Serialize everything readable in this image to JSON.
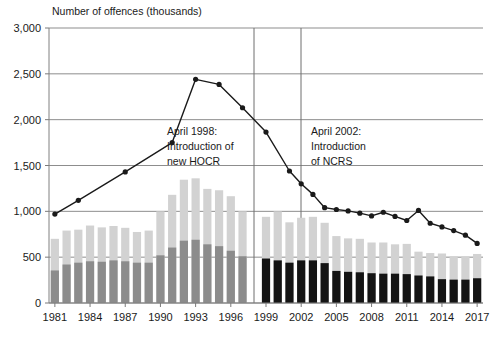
{
  "chart_data": {
    "type": "bar",
    "title": "Number of offences (thousands)",
    "xlabel": "",
    "ylabel": "Number of offences (thousands)",
    "ylim": [
      0,
      3000
    ],
    "ytick_values": [
      0,
      500,
      1000,
      1500,
      2000,
      2500,
      3000
    ],
    "ytick_labels": [
      "0",
      "500",
      "1,000",
      "1,500",
      "2,000",
      "2,500",
      "3,000"
    ],
    "grid": true,
    "legend_position": "none",
    "categories": [
      "1981",
      "1982",
      "1983",
      "1984",
      "1985",
      "1986",
      "1987",
      "1988",
      "1989",
      "1990",
      "1991",
      "1992",
      "1993",
      "1994",
      "1995",
      "1996",
      "1997",
      "1998",
      "1999",
      "2000",
      "2001",
      "2002",
      "2003",
      "2004",
      "2005",
      "2006",
      "2007",
      "2008",
      "2009",
      "2010",
      "2011",
      "2012",
      "2013",
      "2014",
      "2015",
      "2016",
      "2017"
    ],
    "xtick_labels": [
      "1981",
      "1984",
      "1987",
      "1990",
      "1993",
      "1996",
      "1999",
      "2002",
      "2005",
      "2008",
      "2011",
      "2014",
      "2017"
    ],
    "series": [
      {
        "name": "Police recorded crime (total, stacked)",
        "stack": "recorded",
        "type": "bar",
        "color": "#d2d2d2",
        "values": [
          700,
          790,
          800,
          845,
          825,
          840,
          820,
          775,
          790,
          1000,
          1180,
          1345,
          1360,
          1245,
          1230,
          1165,
          1000,
          0,
          940,
          1000,
          880,
          930,
          940,
          875,
          730,
          705,
          700,
          660,
          660,
          640,
          645,
          560,
          545,
          540,
          510,
          510,
          535
        ]
      },
      {
        "name": "Recorded crime lower segment (pre-1999 darker grey / post-1999 black)",
        "stack": "recorded",
        "type": "bar",
        "color_pre_1999": "#8c8c8c",
        "color_post_1999": "#141414",
        "values": [
          355,
          420,
          440,
          455,
          450,
          465,
          455,
          440,
          440,
          520,
          605,
          680,
          690,
          640,
          620,
          570,
          510,
          0,
          485,
          465,
          440,
          465,
          465,
          435,
          350,
          340,
          335,
          325,
          320,
          320,
          315,
          300,
          290,
          260,
          255,
          255,
          270
        ]
      },
      {
        "name": "Crime Survey for England and Wales (CSEW)",
        "type": "line",
        "color": "#1a1a1a",
        "marker": "filled-circle",
        "x": [
          "1981",
          "1983",
          "1987",
          "1991",
          "1993",
          "1995",
          "1997",
          "1999",
          "2001",
          "2002",
          "2003",
          "2004",
          "2005",
          "2006",
          "2007",
          "2008",
          "2009",
          "2010",
          "2011",
          "2012",
          "2013",
          "2014",
          "2015",
          "2016",
          "2017"
        ],
        "values": [
          970,
          1120,
          1430,
          1750,
          2440,
          2385,
          2130,
          1865,
          1440,
          1300,
          1185,
          1040,
          1020,
          1005,
          980,
          950,
          990,
          945,
          900,
          1010,
          870,
          830,
          790,
          740,
          650
        ]
      }
    ],
    "annotations": [
      {
        "name": "april-1998-hocr",
        "lines": [
          "April 1998:",
          "Introduction of",
          "new HOCR"
        ],
        "vline_at": "1998"
      },
      {
        "name": "april-2002-ncrs",
        "lines": [
          "April 2002:",
          "Introduction",
          "of NCRS"
        ],
        "vline_at": "2002"
      }
    ]
  }
}
